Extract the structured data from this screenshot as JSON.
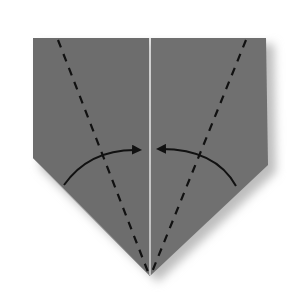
{
  "diagram": {
    "type": "origami-fold-step",
    "paper_color": "#6f6f6f",
    "shadow_color": "#cfcfcf",
    "crease_color": "#111111",
    "arrow_color": "#111111",
    "background": "#ffffff"
  }
}
